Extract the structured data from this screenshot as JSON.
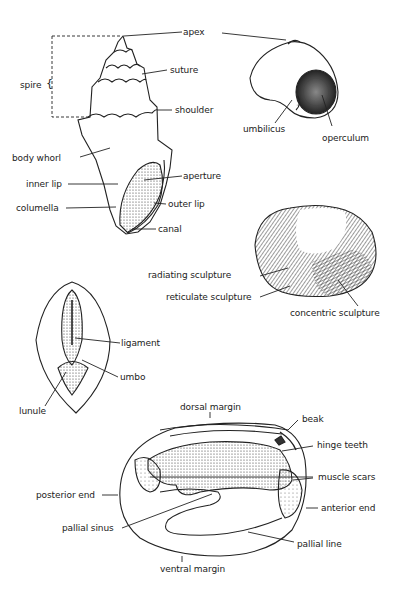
{
  "figures": {
    "gastropod_side": {
      "labels": {
        "apex": "apex",
        "spire": "spire",
        "suture": "suture",
        "shoulder": "shoulder",
        "body_whorl": "body whorl",
        "aperture": "aperture",
        "inner_lip": "inner lip",
        "outer_lip": "outer lip",
        "columella": "columella",
        "canal": "canal"
      }
    },
    "gastropod_coiled": {
      "labels": {
        "umbilicus": "umbilicus",
        "operculum": "operculum"
      }
    },
    "bivalve_exterior": {
      "labels": {
        "radiating_sculpture": "radiating sculpture",
        "reticulate_sculpture": "reticulate sculpture",
        "concentric_sculpture": "concentric sculpture"
      }
    },
    "bivalve_dorsal": {
      "labels": {
        "ligament": "ligament",
        "umbo": "umbo",
        "lunule": "lunule"
      }
    },
    "bivalve_interior": {
      "labels": {
        "dorsal_margin": "dorsal margin",
        "beak": "beak",
        "hinge_teeth": "hinge teeth",
        "muscle_scars": "muscle scars",
        "posterior_end": "posterior end",
        "anterior_end": "anterior end",
        "pallial_sinus": "pallial sinus",
        "pallial_line": "pallial line",
        "ventral_margin": "ventral margin"
      }
    }
  },
  "colors": {
    "ink": "#222222",
    "background": "#ffffff"
  }
}
